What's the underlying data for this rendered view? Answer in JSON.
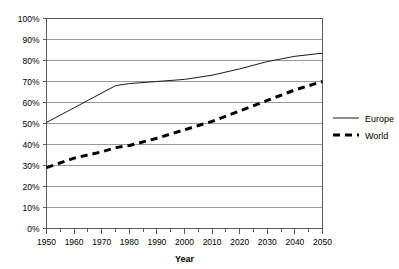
{
  "chart_data": {
    "type": "line",
    "title": "",
    "xlabel": "Year",
    "ylabel": "",
    "xlim": [
      1950,
      2050
    ],
    "ylim": [
      0,
      100
    ],
    "grid": true,
    "legend_position": "right",
    "x": [
      1950,
      1960,
      1970,
      1975,
      1980,
      1990,
      2000,
      2010,
      2020,
      2030,
      2040,
      2050
    ],
    "series": [
      {
        "name": "Europe",
        "style": "solid",
        "values": [
          50.5,
          57.5,
          64.5,
          68.0,
          69.0,
          70.0,
          71.0,
          73.0,
          76.0,
          79.5,
          82.0,
          83.5
        ]
      },
      {
        "name": "World",
        "style": "dashed",
        "values": [
          29.0,
          33.5,
          36.5,
          38.5,
          39.5,
          43.0,
          47.0,
          51.0,
          56.0,
          61.0,
          66.0,
          70.0
        ]
      }
    ],
    "y_ticks": [
      "0%",
      "10%",
      "20%",
      "30%",
      "40%",
      "50%",
      "60%",
      "70%",
      "80%",
      "90%",
      "100%"
    ],
    "y_tick_values": [
      0,
      10,
      20,
      30,
      40,
      50,
      60,
      70,
      80,
      90,
      100
    ],
    "x_ticks": [
      "1950",
      "1960",
      "1970",
      "1980",
      "1990",
      "2000",
      "2010",
      "2020",
      "2030",
      "2040",
      "2050"
    ],
    "x_tick_values": [
      1950,
      1960,
      1970,
      1980,
      1990,
      2000,
      2010,
      2020,
      2030,
      2040,
      2050
    ],
    "x_minor_tick_values": [
      1955,
      1965,
      1975,
      1985,
      1995,
      2005,
      2015,
      2025,
      2035,
      2045
    ],
    "colors": {
      "europe": "#1a1a1a",
      "world": "#000000",
      "grid": "#9a9a9a",
      "axis": "#5a5a5a",
      "background": "#ffffff"
    }
  },
  "legend": {
    "items": [
      {
        "label": "Europe",
        "key": "europe"
      },
      {
        "label": "World",
        "key": "world"
      }
    ]
  },
  "axis_titles": {
    "x": "Year"
  }
}
